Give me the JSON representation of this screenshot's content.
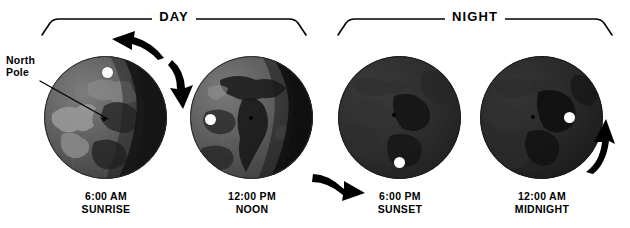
{
  "diagram": {
    "background_color": "#ffffff",
    "ink_color": "#000000"
  },
  "brackets": [
    {
      "id": "day",
      "label": "DAY"
    },
    {
      "id": "night",
      "label": "NIGHT"
    }
  ],
  "annotation": {
    "north_pole": {
      "line1": "North",
      "line2": "Pole"
    }
  },
  "globes": [
    {
      "id": "globe-1",
      "caption_time": "6:00 AM",
      "caption_phase": "SUNRISE",
      "observer_label": "observer-marker",
      "lit_side": "left",
      "terminator_angle_deg": 0
    },
    {
      "id": "globe-2",
      "caption_time": "12:00 PM",
      "caption_phase": "NOON",
      "observer_label": "observer-marker",
      "lit_side": "left",
      "terminator_angle_deg": 0
    },
    {
      "id": "globe-3",
      "caption_time": "6:00 PM",
      "caption_phase": "SUNSET",
      "observer_label": "observer-marker",
      "lit_side": "none",
      "terminator_angle_deg": 0
    },
    {
      "id": "globe-4",
      "caption_time": "12:00 AM",
      "caption_phase": "MIDNIGHT",
      "observer_label": "observer-marker",
      "lit_side": "none",
      "terminator_angle_deg": 0
    }
  ],
  "arrows": [
    {
      "id": "arrow-top-left",
      "name": "rotation-arrow-upper-left",
      "direction": "up-left"
    },
    {
      "id": "arrow-down",
      "name": "rotation-arrow-down",
      "direction": "down"
    },
    {
      "id": "arrow-sunset",
      "name": "rotation-arrow-right",
      "direction": "right"
    },
    {
      "id": "arrow-up-right",
      "name": "rotation-arrow-upper-right",
      "direction": "up-right"
    }
  ],
  "colors": {
    "ocean_lit": "#6d6d6d",
    "ocean_dark": "#2a2a2a",
    "land_lit": "#8e8e8e",
    "land_dark": "#171717",
    "night_shadow": "#0d0d0d",
    "marker_white": "#ffffff"
  }
}
